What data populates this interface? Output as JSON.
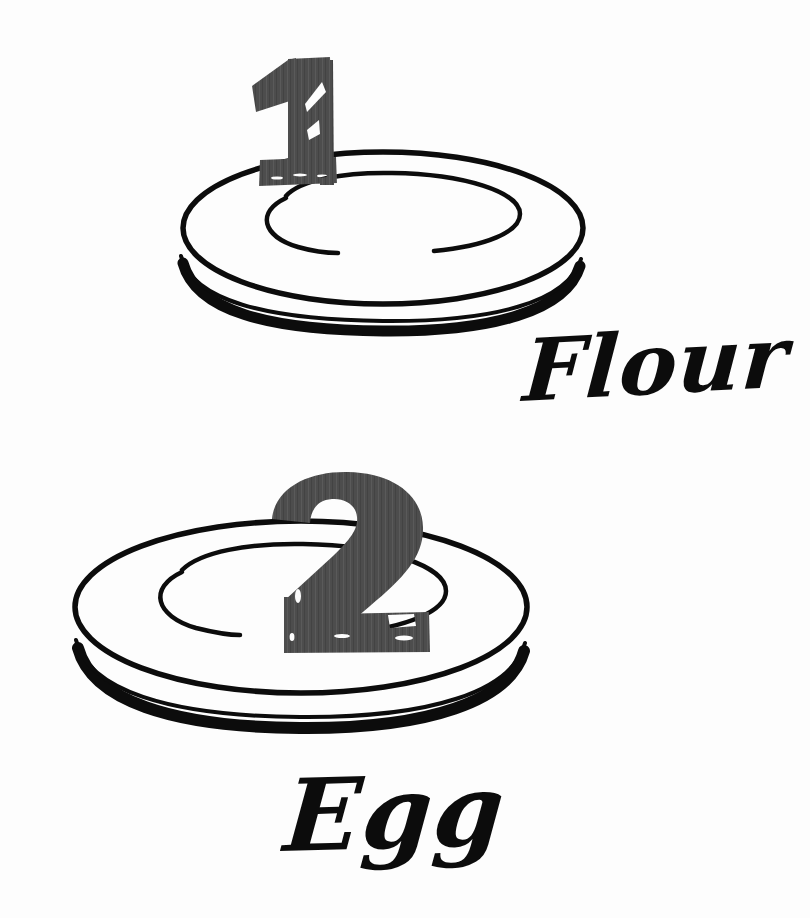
{
  "illustration": {
    "title": "Numbered ingredient plates",
    "style": "hand-drawn black ink line art on white paper",
    "background_color": "#fdfdfd",
    "ink_color": "#0c0c0c",
    "numeral_color": "#4d4d4d"
  },
  "steps": [
    {
      "id": "step-1",
      "number": "1",
      "label": "Flour",
      "plate_name": "plate-one",
      "numeral_color": "#4d4d4d",
      "label_color": "#0c0c0c",
      "label_position": "right-below-plate"
    },
    {
      "id": "step-2",
      "number": "2",
      "label": "Egg",
      "plate_name": "plate-two",
      "numeral_color": "#4d4d4d",
      "label_color": "#0c0c0c",
      "label_position": "below-plate"
    }
  ],
  "icons": {
    "plate_one": "plate-icon",
    "plate_two": "plate-icon",
    "numeral_one": "numeral-one-icon",
    "numeral_two": "numeral-two-icon"
  }
}
